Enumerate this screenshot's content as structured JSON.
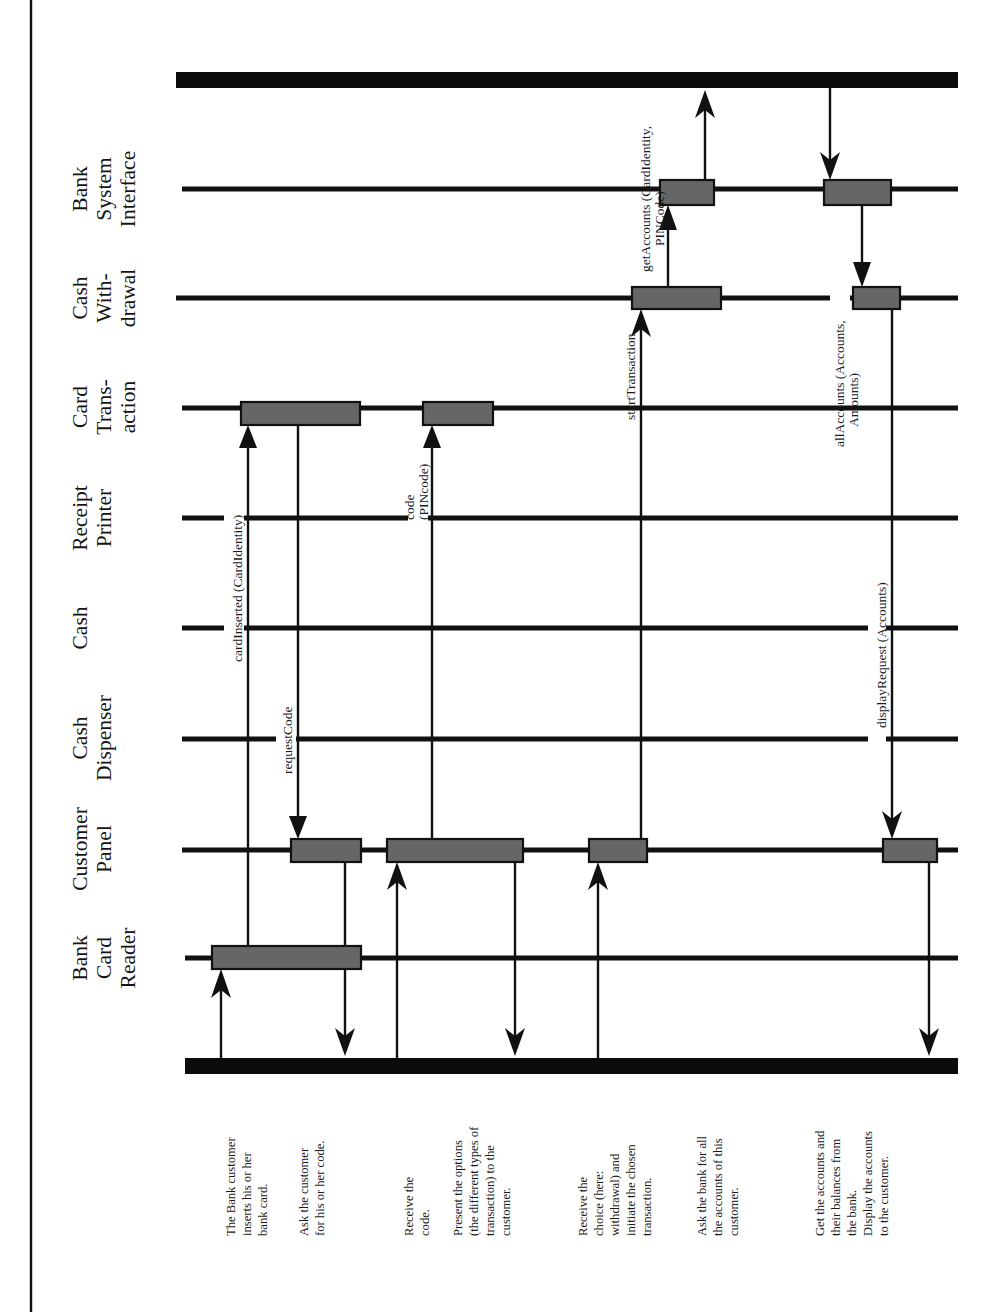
{
  "objects": [
    {
      "id": "bank-system-interface",
      "lines": [
        "Bank",
        "System",
        "Interface"
      ]
    },
    {
      "id": "cash-withdrawal",
      "lines": [
        "Cash",
        "With-",
        "drawal"
      ]
    },
    {
      "id": "card-transaction",
      "lines": [
        "Card",
        "Trans-",
        "action"
      ]
    },
    {
      "id": "receipt-printer",
      "lines": [
        "Receipt",
        "Printer"
      ]
    },
    {
      "id": "cash",
      "lines": [
        "Cash"
      ]
    },
    {
      "id": "cash-dispenser",
      "lines": [
        "Cash",
        "Dispenser"
      ]
    },
    {
      "id": "customer-panel",
      "lines": [
        "Customer",
        "Panel"
      ]
    },
    {
      "id": "bank-card-reader",
      "lines": [
        "Bank",
        "Card",
        "Reader"
      ]
    }
  ],
  "messages": [
    {
      "id": "cardInserted",
      "lines": [
        "cardInserted (CardIdentity)"
      ],
      "from": "Bank Card Reader",
      "to": "Card Transaction"
    },
    {
      "id": "requestCode",
      "lines": [
        "requestCode"
      ],
      "from": "Card Transaction",
      "to": "Customer Panel"
    },
    {
      "id": "code",
      "lines": [
        "code",
        "(PINcode)"
      ],
      "from": "Customer Panel",
      "to": "Card Transaction"
    },
    {
      "id": "startTransaction",
      "lines": [
        "startTransaction"
      ],
      "from": "Customer Panel",
      "to": "Cash Withdrawal"
    },
    {
      "id": "getAccounts",
      "lines": [
        "getAccounts (CardIdentity,",
        "PINCode)"
      ],
      "from": "Cash Withdrawal",
      "to": "Bank System Interface"
    },
    {
      "id": "allAccounts",
      "lines": [
        "allAccounts (Accounts,",
        "Amounts)"
      ],
      "from": "Bank System Interface",
      "to": "Cash Withdrawal"
    },
    {
      "id": "displayRequest",
      "lines": [
        "displayRequest (Accounts)"
      ],
      "from": "Cash Withdrawal",
      "to": "Customer Panel"
    }
  ],
  "notes": [
    {
      "lines": [
        "The Bank customer",
        "inserts his or her",
        "bank card."
      ]
    },
    {
      "lines": [
        "Ask the customer",
        "for his or her code."
      ]
    },
    {
      "lines": [
        "Receive the",
        "code."
      ]
    },
    {
      "lines": [
        "Present the options",
        "(the different types of",
        "transaction) to the",
        "customer."
      ]
    },
    {
      "lines": [
        "Receive the",
        "choice (here:",
        "withdrawal) and",
        "initiate the chosen",
        "transaction."
      ]
    },
    {
      "lines": [
        "Ask the bank for all",
        "the accounts of this",
        "customer."
      ]
    },
    {
      "lines": [
        "Get the accounts and",
        "their balances from",
        "the bank.",
        "Display the accounts",
        "to the customer."
      ]
    }
  ],
  "colors": {
    "activation_fill": "#666666",
    "line": "#111111",
    "background": "#ffffff"
  }
}
